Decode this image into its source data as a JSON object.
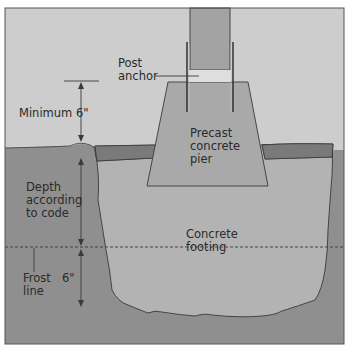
{
  "labels": {
    "post_anchor": [
      "Post",
      "anchor"
    ],
    "minimum": "Minimum 6\"",
    "precast_pier": [
      "Precast",
      "concrete",
      "pier"
    ],
    "depth": [
      "Depth",
      "according",
      "to code"
    ],
    "concrete_footing": [
      "Concrete",
      "footing"
    ],
    "frost_line": [
      "Frost",
      "line"
    ],
    "six_inch": "6\""
  },
  "colors": {
    "sky": "#cdcdcd",
    "soil": "#8f8f8f",
    "sod": "#7a7a7a",
    "footing": "#b3b3b3",
    "pier": "#a9a9a9",
    "post": "#a3a3a3",
    "anchor": "#dedede",
    "line": "#3a3a3a",
    "border": "#555555"
  }
}
